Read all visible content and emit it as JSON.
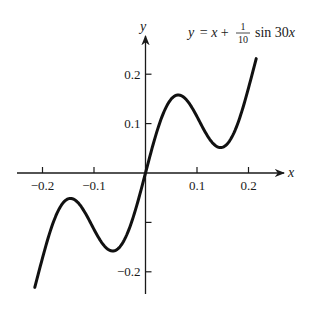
{
  "chart_data": {
    "type": "line",
    "title_parts": {
      "lhs": "y",
      "eq": "= ",
      "x": "x",
      "plus": " + ",
      "num": "1",
      "den": "10",
      "fn": "sin 30",
      "arg": "x"
    },
    "xlabel": "x",
    "ylabel": "y",
    "xlim": [
      -0.27,
      0.28
    ],
    "ylim": [
      -0.26,
      0.27
    ],
    "grid": false,
    "legend": null,
    "x_ticks": [
      -0.2,
      -0.1,
      0.1,
      0.2
    ],
    "x_tick_labels": [
      "−0.2",
      "−0.1",
      "0.1",
      "0.2"
    ],
    "y_ticks": [
      -0.2,
      -0.1,
      0.1,
      0.2
    ],
    "y_tick_labels": [
      "−0.2",
      "",
      "0.1",
      "0.2"
    ],
    "function": "x + 0.1*sin(30*x)",
    "x_domain": [
      -0.215,
      0.215
    ],
    "series": [
      {
        "name": "y = x + (1/10) sin 30x",
        "x": [
          -0.215,
          -0.2,
          -0.18,
          -0.16,
          -0.1466,
          -0.13,
          -0.11,
          -0.09,
          -0.0628,
          -0.04,
          -0.02,
          0.0,
          0.02,
          0.04,
          0.0628,
          0.09,
          0.11,
          0.13,
          0.1466,
          0.16,
          0.18,
          0.2,
          0.215
        ],
        "values": [
          -0.236,
          -0.172,
          -0.103,
          -0.062,
          -0.052,
          -0.067,
          -0.094,
          -0.133,
          -0.157,
          -0.133,
          -0.076,
          0.0,
          0.076,
          0.133,
          0.157,
          0.133,
          0.094,
          0.067,
          0.052,
          0.062,
          0.103,
          0.172,
          0.236
        ]
      }
    ]
  },
  "labels": {
    "x_axis": "x",
    "y_axis": "y"
  }
}
